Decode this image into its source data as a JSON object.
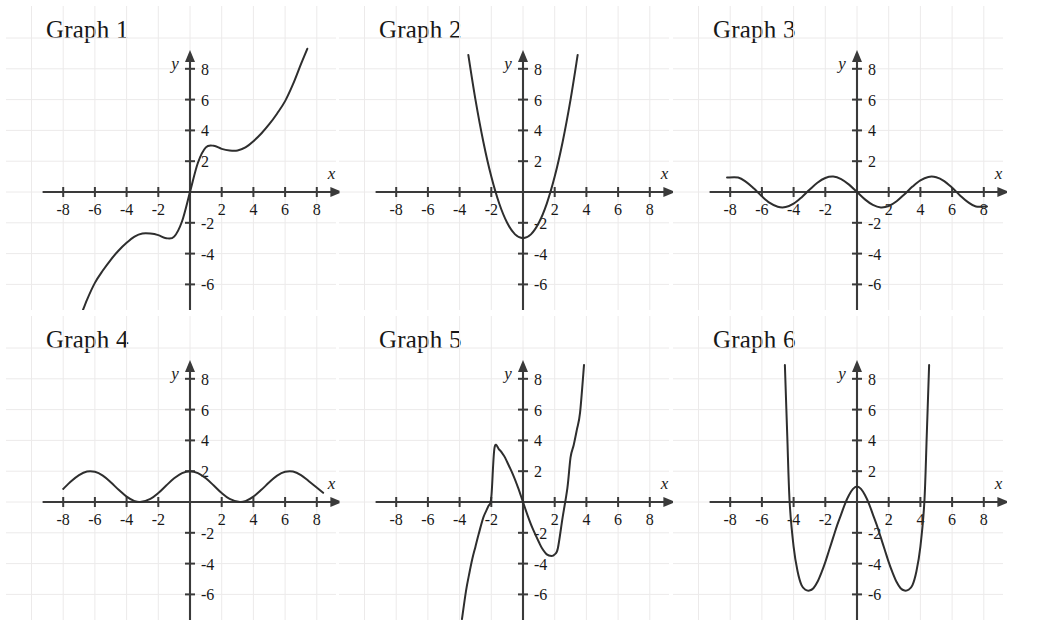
{
  "page": {
    "background": "#ffffff",
    "curve_color": "#2e2e2e",
    "axis_color": "#3a3a3a",
    "grid_color": "#eceaea",
    "columns": 3,
    "rows": 2
  },
  "axes": {
    "x_label": "x",
    "y_label": "y",
    "x_ticks": [
      -8,
      -6,
      -4,
      -2,
      2,
      4,
      6,
      8
    ],
    "y_ticks": [
      8,
      6,
      4,
      2,
      -2,
      -4,
      -6
    ],
    "x_tick_labels": [
      "-8",
      "-6",
      "-4",
      "-2",
      "2",
      "4",
      "6",
      "8"
    ],
    "y_tick_labels": [
      "8",
      "6",
      "4",
      "2",
      "-2",
      "-4",
      "-6"
    ],
    "xlim": [
      -9.2,
      9.2
    ],
    "ylim": [
      -7.6,
      8.9
    ],
    "grid": true,
    "grid_step": 2
  },
  "chart_data": [
    {
      "type": "line",
      "title": "Graph 1",
      "xlabel": "x",
      "ylabel": "y",
      "xlim": [
        -9.2,
        9.2
      ],
      "ylim": [
        -7.6,
        8.9
      ],
      "grid": true,
      "legend": null,
      "description": "Increasing odd function with flat inflection plateaus near (-2.7,-2.9) and (2.7,2.9)",
      "expression": "x + 2*sin(x)",
      "x": [
        -7.6,
        -7.0,
        -6.5,
        -6.0,
        -5.5,
        -5.0,
        -4.5,
        -4.0,
        -3.5,
        -3.0,
        -2.5,
        -2.0,
        -1.5,
        -1.0,
        -0.5,
        0.0,
        0.5,
        1.0,
        1.5,
        2.0,
        2.5,
        3.0,
        3.5,
        4.0,
        4.5,
        5.0,
        5.5,
        6.0,
        6.5,
        7.0,
        7.4
      ],
      "y": [
        -9.5,
        -8.3,
        -7.0,
        -5.9,
        -5.1,
        -4.4,
        -3.8,
        -3.3,
        -2.9,
        -2.7,
        -2.7,
        -2.8,
        -3.0,
        -2.9,
        -1.9,
        0.0,
        1.9,
        2.9,
        3.0,
        2.8,
        2.7,
        2.7,
        2.9,
        3.3,
        3.8,
        4.4,
        5.1,
        5.9,
        7.0,
        8.3,
        9.3
      ]
    },
    {
      "type": "line",
      "title": "Graph 2",
      "xlabel": "x",
      "ylabel": "y",
      "xlim": [
        -9.2,
        9.2
      ],
      "ylim": [
        -7.6,
        8.9
      ],
      "grid": true,
      "legend": null,
      "description": "Upward parabola, vertex (0,-3), x-intercepts near -1.75 and 1.75",
      "expression": "x^2 - 3",
      "vertex": [
        0,
        -3
      ],
      "roots": [
        -1.73,
        1.73
      ],
      "x": [
        -3.45,
        -3.0,
        -2.5,
        -2.0,
        -1.5,
        -1.0,
        -0.5,
        0.0,
        0.5,
        1.0,
        1.5,
        2.0,
        2.5,
        3.0,
        3.45
      ],
      "y": [
        8.9,
        6.0,
        3.25,
        1.0,
        -0.75,
        -2.0,
        -2.75,
        -3.0,
        -2.75,
        -2.0,
        -0.75,
        1.0,
        3.25,
        6.0,
        8.9
      ]
    },
    {
      "type": "line",
      "title": "Graph 3",
      "xlabel": "x",
      "ylabel": "y",
      "xlim": [
        -9.2,
        9.2
      ],
      "ylim": [
        -7.6,
        8.9
      ],
      "grid": true,
      "legend": null,
      "description": "Sine wave amplitude 1, period 2 pi, decreasing through the origin",
      "expression": "-sin(x)",
      "amplitude": 1,
      "period": 6.28,
      "x": [
        -8.2,
        -7.5,
        -7.0,
        -6.5,
        -6.0,
        -5.5,
        -5.0,
        -4.5,
        -4.0,
        -3.5,
        -3.0,
        -2.5,
        -2.0,
        -1.5,
        -1.0,
        -0.5,
        0.0,
        0.5,
        1.0,
        1.5,
        2.0,
        2.5,
        3.0,
        3.5,
        4.0,
        4.5,
        5.0,
        5.5,
        6.0,
        6.5,
        7.0,
        7.5,
        8.2
      ],
      "y": [
        0.94,
        0.94,
        0.66,
        0.22,
        -0.28,
        -0.71,
        -0.96,
        -0.98,
        -0.76,
        -0.35,
        0.14,
        0.6,
        0.91,
        1.0,
        0.84,
        0.48,
        0.0,
        -0.48,
        -0.84,
        -1.0,
        -0.91,
        -0.6,
        -0.14,
        0.35,
        0.76,
        0.98,
        0.96,
        0.71,
        0.28,
        -0.22,
        -0.66,
        -0.94,
        -0.94
      ]
    },
    {
      "type": "line",
      "title": "Graph 4",
      "xlabel": "x",
      "ylabel": "y",
      "xlim": [
        -9.2,
        9.2
      ],
      "ylim": [
        -7.6,
        8.9
      ],
      "grid": true,
      "legend": null,
      "description": "Raised cosine oscillating between 0 and 2, maxima at 0 and plus or minus 2 pi, touching the x-axis at plus or minus pi",
      "expression": "1 + cos(x)",
      "amplitude": 1,
      "offset": 1,
      "period": 6.28,
      "x": [
        -8.0,
        -7.5,
        -7.0,
        -6.5,
        -6.0,
        -5.5,
        -5.0,
        -4.5,
        -4.0,
        -3.5,
        -3.14,
        -2.5,
        -2.0,
        -1.5,
        -1.0,
        -0.5,
        0.0,
        0.5,
        1.0,
        1.5,
        2.0,
        2.5,
        3.14,
        3.5,
        4.0,
        4.5,
        5.0,
        5.5,
        6.0,
        6.5,
        7.0,
        7.5,
        8.4
      ],
      "y": [
        0.85,
        1.35,
        1.75,
        1.98,
        1.96,
        1.71,
        1.28,
        0.79,
        0.35,
        0.06,
        0.0,
        0.2,
        0.58,
        1.07,
        1.54,
        1.88,
        2.0,
        1.88,
        1.54,
        1.07,
        0.58,
        0.2,
        0.0,
        0.06,
        0.35,
        0.79,
        1.28,
        1.71,
        1.96,
        1.98,
        1.75,
        1.35,
        0.6
      ]
    },
    {
      "type": "line",
      "title": "Graph 5",
      "xlabel": "x",
      "ylabel": "y",
      "xlim": [
        -9.2,
        9.2
      ],
      "ylim": [
        -7.6,
        8.9
      ],
      "grid": true,
      "legend": null,
      "description": "Cubic with local maximum near (-1.8, 3.5), local minimum near (1.8, -3.5), roots near -3, 0 and 3",
      "expression": "x^3/3 - 3x",
      "local_max": [
        -1.8,
        3.5
      ],
      "local_min": [
        1.8,
        -3.5
      ],
      "roots": [
        -3.0,
        0.0,
        3.0
      ],
      "x": [
        -3.85,
        -3.6,
        -3.4,
        -3.2,
        -3.0,
        -2.8,
        -2.5,
        -2.2,
        -2.0,
        -1.8,
        -1.5,
        -1.2,
        -1.0,
        -0.6,
        -0.3,
        0.0,
        0.3,
        0.6,
        1.0,
        1.2,
        1.5,
        1.8,
        2.0,
        2.2,
        2.5,
        2.8,
        3.0,
        3.2,
        3.4,
        3.6,
        3.85
      ],
      "y": [
        -7.6,
        -5.8,
        -4.7,
        -3.7,
        -2.9,
        -2.1,
        -1.0,
        -0.3,
        0.3,
        3.5,
        3.4,
        3.0,
        2.6,
        1.7,
        0.9,
        0.0,
        -0.9,
        -1.7,
        -2.6,
        -3.0,
        -3.4,
        -3.5,
        -3.4,
        -3.0,
        -1.0,
        0.9,
        2.9,
        3.7,
        4.7,
        5.8,
        8.9
      ]
    },
    {
      "type": "line",
      "title": "Graph 6",
      "xlabel": "x",
      "ylabel": "y",
      "xlim": [
        -9.2,
        9.2
      ],
      "ylim": [
        -7.6,
        8.9
      ],
      "grid": true,
      "legend": null,
      "description": "Quartic W shape, local maximum (0,1), minima near plus or minus 3 at -5.7, roots near plus or minus 0.7 and plus or minus 4.2",
      "expression": "0.08*(x^2-0.5)*(x^2-18)",
      "local_max": [
        0,
        1
      ],
      "local_min": [
        [
          -3.0,
          -5.7
        ],
        [
          3.0,
          -5.7
        ]
      ],
      "roots": [
        -4.25,
        -0.72,
        0.72,
        4.25
      ],
      "x": [
        -4.55,
        -4.4,
        -4.25,
        -4.0,
        -3.75,
        -3.5,
        -3.25,
        -3.0,
        -2.75,
        -2.5,
        -2.25,
        -2.0,
        -1.75,
        -1.5,
        -1.25,
        -1.0,
        -0.75,
        -0.5,
        -0.25,
        0.0,
        0.25,
        0.5,
        0.75,
        1.0,
        1.25,
        1.5,
        1.75,
        2.0,
        2.25,
        2.5,
        2.75,
        3.0,
        3.25,
        3.5,
        3.75,
        4.0,
        4.25,
        4.4,
        4.55
      ],
      "y": [
        8.9,
        4.3,
        0.0,
        -2.9,
        -4.5,
        -5.4,
        -5.7,
        -5.75,
        -5.6,
        -5.2,
        -4.6,
        -3.9,
        -3.1,
        -2.3,
        -1.5,
        -0.8,
        -0.1,
        0.45,
        0.85,
        1.0,
        0.85,
        0.45,
        -0.1,
        -0.8,
        -1.5,
        -2.3,
        -3.1,
        -3.9,
        -4.6,
        -5.2,
        -5.6,
        -5.75,
        -5.7,
        -5.4,
        -4.5,
        -2.9,
        0.0,
        4.3,
        8.9
      ]
    }
  ]
}
